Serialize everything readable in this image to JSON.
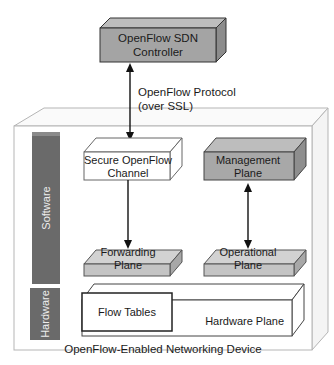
{
  "controller": {
    "line1": "OpenFlow SDN",
    "line2": "Controller"
  },
  "protocol": {
    "line1": "OpenFlow Protocol",
    "line2": "(over SSL)"
  },
  "secure_channel": {
    "line1": "Secure OpenFlow",
    "line2": "Channel"
  },
  "management_plane": {
    "line1": "Management",
    "line2": "Plane"
  },
  "forwarding_plane": {
    "line1": "Forwarding",
    "line2": "Plane"
  },
  "operational_plane": {
    "line1": "Operational",
    "line2": "Plane"
  },
  "flow_tables": "Flow Tables",
  "hardware_plane": "Hardware Plane",
  "software_label": "Software",
  "hardware_label": "Hardware",
  "device_label": "OpenFlow-Enabled Networking Device",
  "colors": {
    "box_gray": "#a8a8a8",
    "side_gray": "#8f8f8f",
    "top_gray": "#c4c4c4",
    "bar": "#6a6a6a",
    "light_box": "#c8c8c8"
  }
}
